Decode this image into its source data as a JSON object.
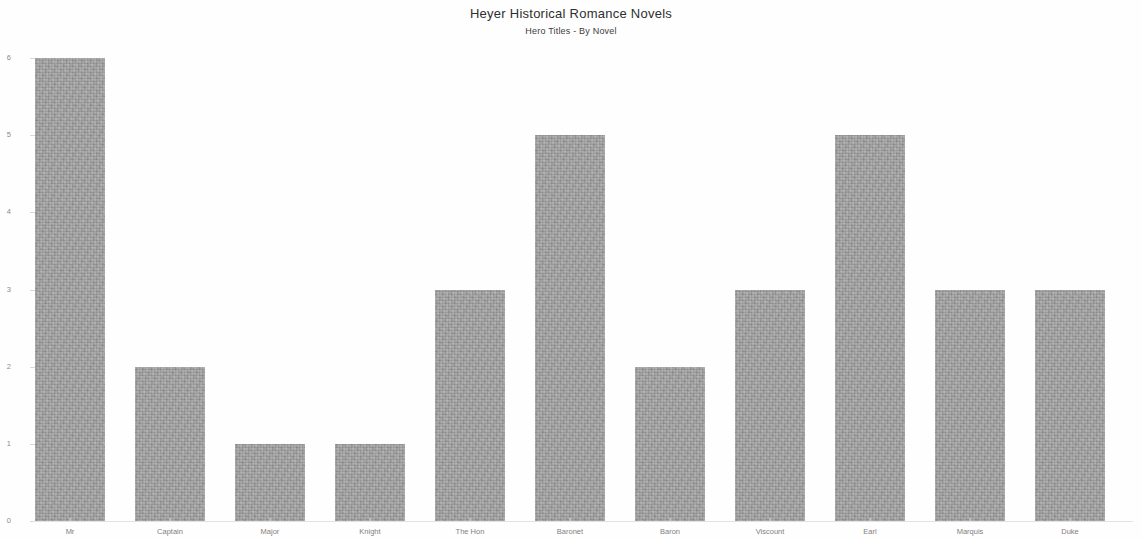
{
  "chart_data": {
    "type": "bar",
    "title": "Heyer Historical Romance Novels",
    "subtitle": "Hero Titles - By Novel",
    "xlabel": "",
    "ylabel": "",
    "categories": [
      "Mr",
      "Captain",
      "Major",
      "Knight",
      "The Hon",
      "Baronet",
      "Baron",
      "Viscount",
      "Earl",
      "Marquis",
      "Duke"
    ],
    "values": [
      6,
      2,
      1,
      1,
      3,
      5,
      2,
      3,
      5,
      3,
      3
    ],
    "ylim": [
      0,
      6
    ],
    "yticks": [
      0,
      1,
      2,
      3,
      4,
      5,
      6
    ],
    "ytick_labels": [
      "0",
      "1",
      "2",
      "3",
      "4",
      "5",
      "6"
    ],
    "grid": false,
    "legend": null,
    "bar_color": "#9d9d9d",
    "background_color": "#ffffff",
    "text_color": "#4a4a4a"
  }
}
